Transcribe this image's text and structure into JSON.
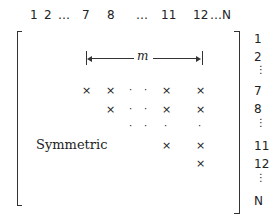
{
  "column_labels": {
    "c1": "1",
    "c2": "2",
    "c_ell1": "…",
    "c7": "7",
    "c8": "8",
    "c_ell2": "…",
    "c11": "11",
    "c12": "12",
    "c_ellN": "…N"
  },
  "row_labels": {
    "r1": "1",
    "r2": "2",
    "r7": "7",
    "r8": "8",
    "r11": "11",
    "r12": "12",
    "rN": "N"
  },
  "bandwidth_label": "m",
  "symmetric_label": "Symmetric",
  "glyphs": {
    "cross": "×",
    "dot": "·",
    "small_dot": ".",
    "vdots": "⋮"
  }
}
